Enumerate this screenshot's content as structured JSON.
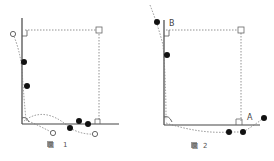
{
  "figures": [
    {
      "id": "fig1",
      "caption_prefix": "図",
      "caption_number": "1",
      "labels": []
    },
    {
      "id": "fig2",
      "caption_prefix": "図",
      "caption_number": "2",
      "labels": [
        {
          "text": "B"
        },
        {
          "text": "A"
        }
      ]
    }
  ],
  "colors": {
    "axis": "#444444",
    "dotted": "#777777",
    "point_filled": "#111111",
    "point_open": "#666666",
    "caption": "#555555"
  }
}
